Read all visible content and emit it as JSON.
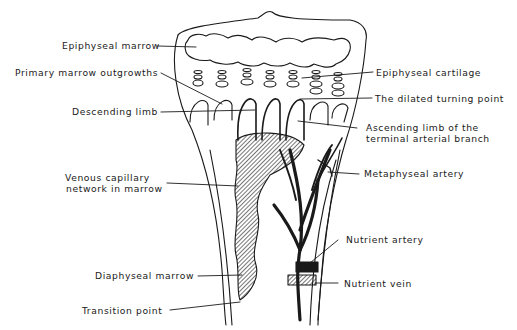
{
  "figure": {
    "type": "anatomical line drawing"
  },
  "labels": {
    "epiphyseal_marrow": "Epiphyseal marrow",
    "primary_marrow_outgrowths": "Primary marrow outgrowths",
    "descending_limb": "Descending limb",
    "venous_capillary_network_1": "Venous capillary",
    "venous_capillary_network_2": "network in marrow",
    "diaphyseal_marrow": "Diaphyseal marrow",
    "transition_point": "Transition point",
    "epiphyseal_cartilage": "Epiphyseal cartilage",
    "dilated_turning_point": "The dilated turning point",
    "ascending_limb_1": "Ascending limb of the",
    "ascending_limb_2": "terminal arterial branch",
    "metaphyseal_artery": "Metaphyseal artery",
    "nutrient_artery": "Nutrient artery",
    "nutrient_vein": "Nutrient vein"
  },
  "colors": {
    "ink": "#1a1a1a",
    "background": "#ffffff"
  }
}
